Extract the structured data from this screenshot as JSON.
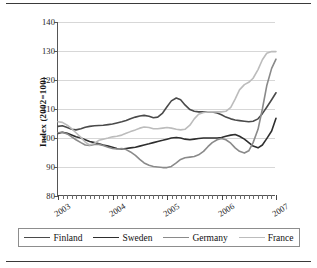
{
  "chart_data": {
    "type": "line",
    "title": "",
    "xlabel": "",
    "ylabel": "Index (2002=100)",
    "ylim": [
      80,
      140
    ],
    "yticks": [
      80,
      90,
      100,
      110,
      120,
      130,
      140
    ],
    "xlim": [
      2003,
      2007
    ],
    "xticks": [
      2003,
      2004,
      2005,
      2006,
      2007
    ],
    "xtick_labels": [
      "2003",
      "2004",
      "2005",
      "2006",
      "2007"
    ],
    "grid": "horizontal",
    "legend_position": "bottom",
    "x": [
      2003.0,
      2003.08,
      2003.17,
      2003.25,
      2003.33,
      2003.42,
      2003.5,
      2003.58,
      2003.67,
      2003.75,
      2003.83,
      2003.92,
      2004.0,
      2004.08,
      2004.17,
      2004.25,
      2004.33,
      2004.42,
      2004.5,
      2004.58,
      2004.67,
      2004.75,
      2004.83,
      2004.92,
      2005.0,
      2005.08,
      2005.17,
      2005.25,
      2005.33,
      2005.42,
      2005.5,
      2005.58,
      2005.67,
      2005.75,
      2005.83,
      2005.92,
      2006.0,
      2006.08,
      2006.17,
      2006.25,
      2006.33,
      2006.42,
      2006.5,
      2006.58,
      2006.67,
      2006.75,
      2006.83,
      2006.92,
      2007.0
    ],
    "series": [
      {
        "name": "Finland",
        "color": "#4a4a4a",
        "width": 1.6,
        "values": [
          104.0,
          104.2,
          103.6,
          103.0,
          102.8,
          103.2,
          103.7,
          104.0,
          104.2,
          104.3,
          104.4,
          104.6,
          104.8,
          105.2,
          105.6,
          106.0,
          106.6,
          107.2,
          107.6,
          107.8,
          107.5,
          107.0,
          107.2,
          108.6,
          110.8,
          112.8,
          113.8,
          113.2,
          111.4,
          109.8,
          109.2,
          109.0,
          109.0,
          109.0,
          109.0,
          108.6,
          108.0,
          107.2,
          106.6,
          106.2,
          106.0,
          105.8,
          105.6,
          105.8,
          106.6,
          108.4,
          110.6,
          113.2,
          115.6
        ]
      },
      {
        "name": "Sweden",
        "color": "#2e2e2e",
        "width": 1.6,
        "values": [
          101.6,
          102.0,
          101.6,
          101.0,
          100.4,
          100.0,
          99.4,
          98.8,
          98.4,
          98.0,
          97.6,
          97.2,
          96.8,
          96.4,
          96.2,
          96.4,
          96.6,
          96.8,
          97.2,
          97.6,
          98.0,
          98.4,
          98.8,
          99.2,
          99.6,
          100.0,
          100.2,
          100.0,
          99.6,
          99.4,
          99.6,
          99.8,
          100.0,
          100.0,
          100.0,
          100.0,
          100.2,
          100.6,
          101.0,
          101.2,
          100.6,
          99.6,
          98.4,
          97.2,
          96.6,
          97.6,
          99.8,
          102.4,
          106.8
        ]
      },
      {
        "name": "Germany",
        "color": "#8a8a8a",
        "width": 1.6,
        "values": [
          101.8,
          102.0,
          101.4,
          100.4,
          99.4,
          98.4,
          97.6,
          97.4,
          97.8,
          97.8,
          97.4,
          96.8,
          96.4,
          96.2,
          96.4,
          96.0,
          95.2,
          94.0,
          92.6,
          91.4,
          90.6,
          90.2,
          90.0,
          89.8,
          89.8,
          90.2,
          91.4,
          92.6,
          93.2,
          93.4,
          93.6,
          94.2,
          95.4,
          97.0,
          98.4,
          99.4,
          99.8,
          99.4,
          98.2,
          96.6,
          95.4,
          94.8,
          95.6,
          98.4,
          103.0,
          110.0,
          118.0,
          124.0,
          127.2
        ]
      },
      {
        "name": "France",
        "color": "#bcbcbc",
        "width": 1.6,
        "values": [
          105.6,
          105.4,
          104.4,
          103.2,
          101.8,
          100.2,
          98.6,
          97.6,
          98.2,
          99.2,
          99.6,
          100.0,
          100.4,
          100.6,
          101.0,
          101.6,
          102.2,
          102.8,
          103.4,
          103.8,
          103.6,
          103.2,
          103.2,
          103.4,
          103.6,
          103.4,
          103.0,
          102.8,
          103.0,
          104.4,
          106.6,
          108.2,
          108.8,
          109.0,
          109.0,
          109.0,
          109.0,
          109.2,
          110.6,
          113.4,
          116.6,
          118.4,
          119.2,
          120.6,
          123.6,
          127.0,
          129.2,
          129.8,
          129.8
        ]
      }
    ]
  },
  "legend": {
    "items": [
      {
        "label": "Finland"
      },
      {
        "label": "Sweden"
      },
      {
        "label": "Germany"
      },
      {
        "label": "France"
      }
    ]
  }
}
